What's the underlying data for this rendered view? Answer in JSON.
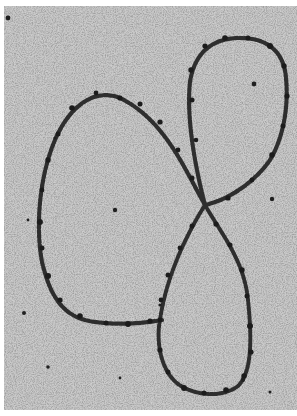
{
  "image": {
    "kind": "electron-micrograph",
    "subject": "beaded chromatin / DNA strand forming a figure-eight loop",
    "width": 297,
    "height": 416,
    "colors": {
      "background": "#c9c9c9",
      "speckle_dark": "#4a4a4a",
      "speckle_mid": "#8a8a8a",
      "strand": "#2b2b2b",
      "bead": "#1e1e1e",
      "border": "#ffffff"
    },
    "features": [
      {
        "name": "large-left-loop",
        "description": "large oval loop occupying left half"
      },
      {
        "name": "upper-right-loop",
        "description": "smaller oval loop in upper right"
      },
      {
        "name": "lower-right-loop",
        "description": "elongated teardrop loop in lower right"
      },
      {
        "name": "crossover",
        "description": "strand crossing point near center-right",
        "x": 205,
        "y": 205
      },
      {
        "name": "particles",
        "description": "scattered dark particles in background"
      }
    ]
  }
}
